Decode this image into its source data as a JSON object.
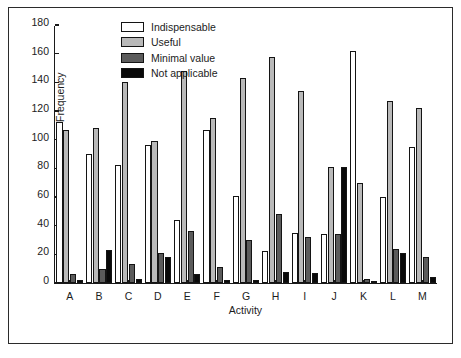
{
  "chart_data": {
    "type": "bar",
    "title": "",
    "subtitle": "",
    "xlabel": "Activity",
    "ylabel": "Frequency",
    "ylim": [
      0,
      180
    ],
    "ytick_step": 20,
    "yticks": [
      0,
      20,
      40,
      60,
      80,
      100,
      120,
      140,
      160,
      180
    ],
    "grid": false,
    "legend_position": "top-left-inside",
    "categories": [
      "A",
      "B",
      "C",
      "D",
      "E",
      "F",
      "G",
      "H",
      "I",
      "J",
      "K",
      "L",
      "M"
    ],
    "series": [
      {
        "name": "Indispensable",
        "color": "#ffffff",
        "values": [
          112,
          90,
          82,
          96,
          44,
          107,
          61,
          22,
          35,
          34,
          162,
          60,
          95
        ]
      },
      {
        "name": "Useful",
        "color": "#b9b9b9",
        "values": [
          107,
          108,
          140,
          99,
          148,
          115,
          143,
          158,
          134,
          81,
          70,
          127,
          122
        ]
      },
      {
        "name": "Minimal value",
        "color": "#5b5b5b",
        "values": [
          6,
          10,
          13,
          21,
          36,
          11,
          30,
          48,
          32,
          34,
          3,
          24,
          18
        ]
      },
      {
        "name": "Not applicable",
        "color": "#090909",
        "values": [
          2,
          23,
          3,
          18,
          6,
          2,
          2,
          8,
          7,
          81,
          1,
          21,
          4
        ]
      }
    ]
  }
}
